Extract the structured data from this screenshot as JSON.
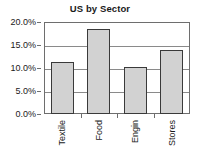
{
  "chart_data": {
    "type": "bar",
    "title": "US by Sector",
    "xlabel": "",
    "ylabel": "",
    "categories": [
      "Textile",
      "Food",
      "Engin",
      "Stores"
    ],
    "values": [
      11.4,
      18.4,
      10.2,
      14.0
    ],
    "ylim": [
      0,
      20
    ],
    "ytick_values": [
      0,
      5,
      10,
      15,
      20
    ],
    "ytick_labels": [
      "0.0%",
      "5.0%",
      "10.0%",
      "15.0%",
      "20.0%"
    ],
    "grid": true,
    "legend": null,
    "legend_position": "none",
    "bar_fill_color": "#d2d2d2",
    "bar_edge_color": "#3a3a3a",
    "frame_color": "#6e6e6e",
    "text_color": "#1a1a1a"
  }
}
